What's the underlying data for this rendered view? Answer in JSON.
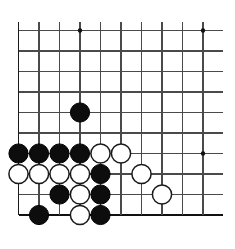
{
  "figure": {
    "name": "go-board-corner-diagram",
    "type": "go-board-position",
    "title": "",
    "board": {
      "columns": 10,
      "rows": 9,
      "origin_x": 18.5,
      "origin_y": 30.5,
      "spacing": 20.5,
      "line_extend_right": 20,
      "line_extend_top": 9,
      "stone_radius": 9.6,
      "hoshi_radius": 2.2,
      "line_color": "#4a4a4a",
      "edge_color": "#1a1a1a",
      "bottom_edge_color": "#111111",
      "black_color": "#0d0d0d",
      "white_color": "#ffffff",
      "background_color": "#ffffff"
    },
    "hoshi_points": [
      {
        "col": 4,
        "row": 1
      },
      {
        "col": 10,
        "row": 1
      },
      {
        "col": 10,
        "row": 7
      }
    ],
    "stones": [
      {
        "color": "black",
        "col": 4,
        "row": 5
      },
      {
        "color": "black",
        "col": 1,
        "row": 7
      },
      {
        "color": "black",
        "col": 2,
        "row": 7
      },
      {
        "color": "black",
        "col": 3,
        "row": 7
      },
      {
        "color": "black",
        "col": 4,
        "row": 7
      },
      {
        "color": "white",
        "col": 5,
        "row": 7
      },
      {
        "color": "white",
        "col": 6,
        "row": 7
      },
      {
        "color": "white",
        "col": 1,
        "row": 8
      },
      {
        "color": "white",
        "col": 2,
        "row": 8
      },
      {
        "color": "white",
        "col": 3,
        "row": 8
      },
      {
        "color": "white",
        "col": 4,
        "row": 8
      },
      {
        "color": "black",
        "col": 5,
        "row": 8
      },
      {
        "color": "white",
        "col": 7,
        "row": 8
      },
      {
        "color": "black",
        "col": 3,
        "row": 9
      },
      {
        "color": "white",
        "col": 4,
        "row": 9
      },
      {
        "color": "black",
        "col": 5,
        "row": 9
      },
      {
        "color": "white",
        "col": 8,
        "row": 9
      },
      {
        "color": "black",
        "col": 2,
        "row": 10
      },
      {
        "color": "white",
        "col": 4,
        "row": 10
      },
      {
        "color": "black",
        "col": 5,
        "row": 10
      }
    ]
  }
}
